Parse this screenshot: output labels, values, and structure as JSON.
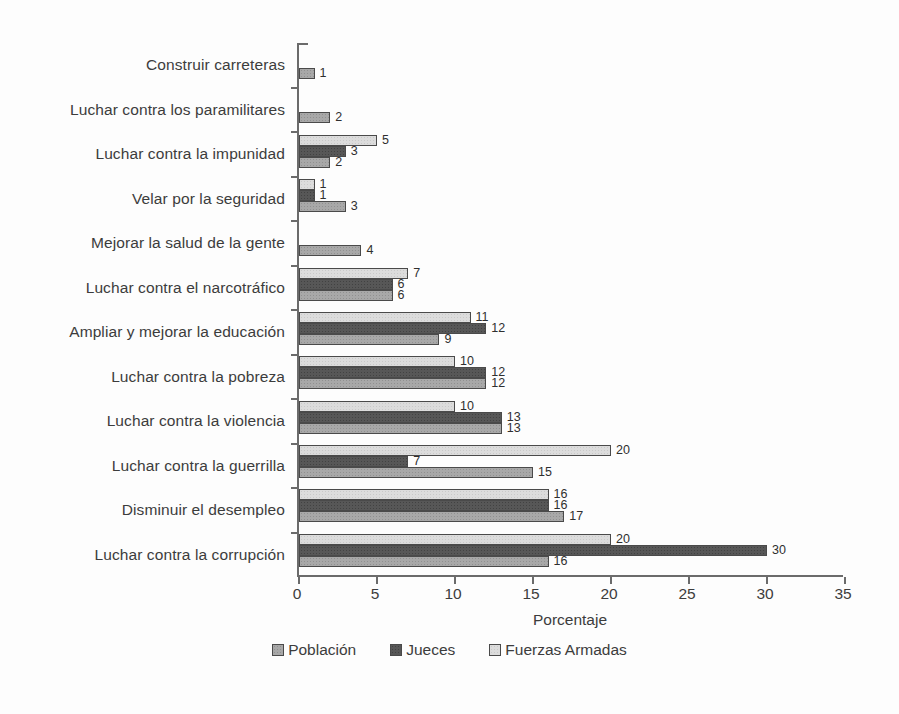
{
  "chart_data": {
    "type": "bar",
    "orientation": "horizontal",
    "title": "",
    "xlabel": "Porcentaje",
    "xlim": [
      0,
      35
    ],
    "xticks": [
      0,
      5,
      10,
      15,
      20,
      25,
      30,
      35
    ],
    "grid": false,
    "legend_position": "bottom",
    "categories": [
      "Construir carreteras",
      "Luchar contra los paramilitares",
      "Luchar contra la impunidad",
      "Velar por la seguridad",
      "Mejorar la salud de la gente",
      "Luchar contra el narcotráfico",
      "Ampliar y mejorar la educación",
      "Luchar contra la pobreza",
      "Luchar contra la violencia",
      "Luchar contra la guerrilla",
      "Disminuir el desempleo",
      "Luchar contra la corrupción"
    ],
    "series": [
      {
        "name": "Población",
        "color": "#a8a8a8",
        "values": [
          1,
          2,
          2,
          3,
          4,
          6,
          9,
          12,
          13,
          15,
          17,
          16
        ]
      },
      {
        "name": "Jueces",
        "color": "#575757",
        "values": [
          null,
          null,
          3,
          1,
          null,
          6,
          12,
          12,
          13,
          7,
          16,
          30
        ]
      },
      {
        "name": "Fuerzas Armadas",
        "color": "#dcdcdc",
        "values": [
          null,
          null,
          5,
          1,
          null,
          7,
          11,
          10,
          10,
          20,
          16,
          20
        ]
      }
    ],
    "bar_order_top_to_bottom": [
      "Fuerzas Armadas",
      "Jueces",
      "Población"
    ]
  }
}
